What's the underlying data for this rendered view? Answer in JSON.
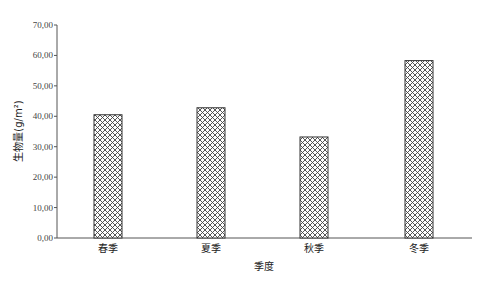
{
  "chart_data": {
    "type": "bar",
    "title": "",
    "xlabel": "季度",
    "ylabel": "生物量(g/m²)",
    "categories": [
      "春季",
      "夏季",
      "秋季",
      "冬季"
    ],
    "values": [
      40.5,
      42.8,
      33.2,
      58.3
    ],
    "ylim": [
      0,
      70
    ],
    "yticks": [
      0,
      10,
      20,
      30,
      40,
      50,
      60,
      70
    ],
    "ytick_labels": [
      "0,00",
      "10,00",
      "20,00",
      "30,00",
      "40,00",
      "50,00",
      "60,00",
      "70,00"
    ],
    "grid": false,
    "legend": null,
    "bar_fill": "diagonal-crosshatch",
    "colors": {
      "axis": "#555555",
      "bar_stroke": "#333333",
      "hatch": "#444444"
    }
  }
}
